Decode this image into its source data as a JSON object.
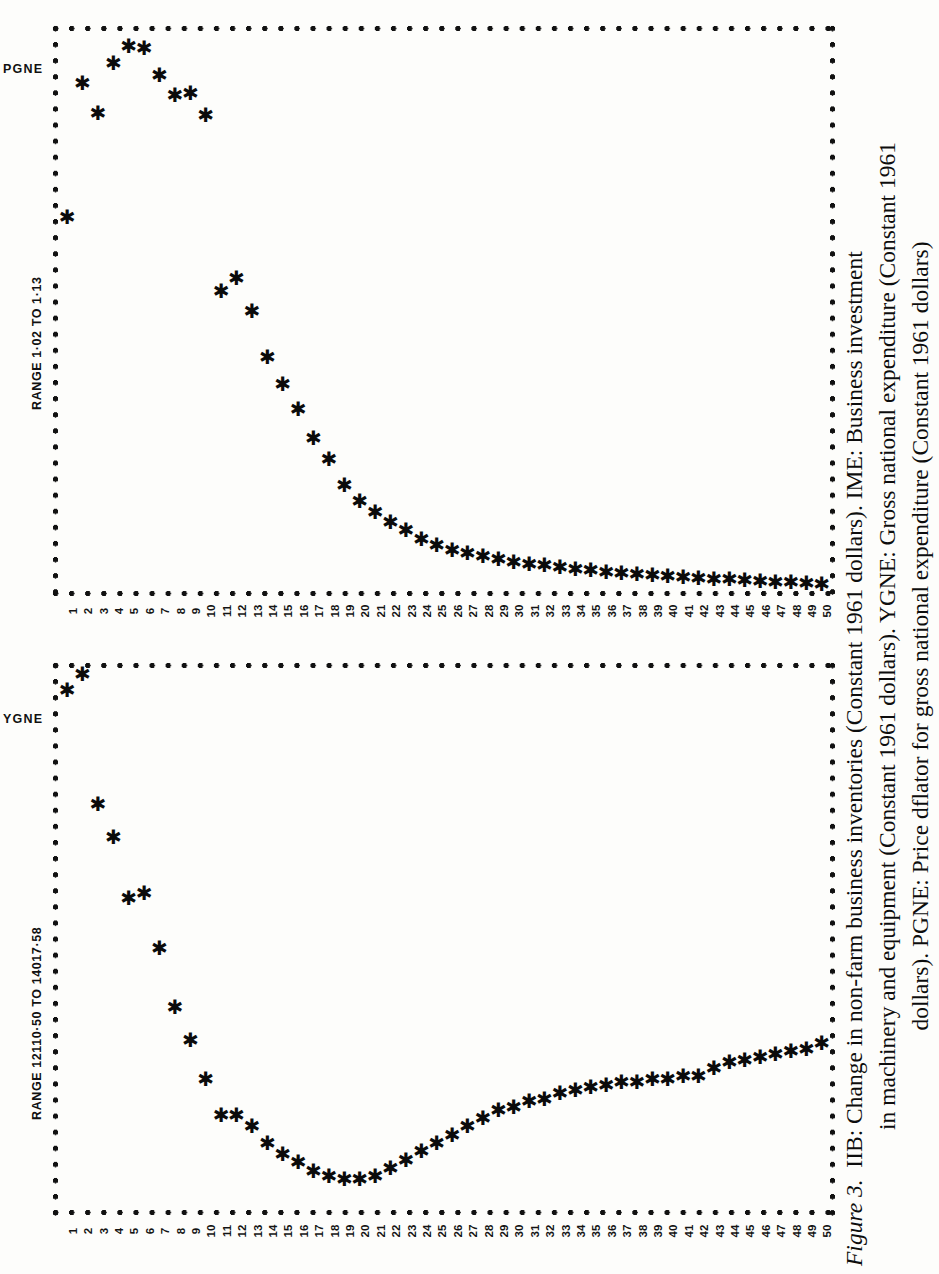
{
  "figure": {
    "label": "Figure 3.",
    "caption_lines": [
      "IIB: Change in non-farm business inventories (Constant 1961 dollars). IME: Business investment",
      "in machinery and equipment (Constant 1961 dollars). YGNE: Gross national expenditure (Constant 1961",
      "dollars). PGNE: Price dflator for gross national expenditure (Constant 1961 dollars)"
    ],
    "caption_full": "Figure 3. IIB: Change in non-farm business inventories (Constant 1961 dollars). IME: Business investment in machinery and equipment (Constant 1961 dollars). YGNE: Gross national expenditure (Constant 1961 dollars). PGNE: Price dflator for gross national expenditure (Constant 1961 dollars)"
  },
  "chart_data": [
    {
      "type": "scatter",
      "panel_id": "pgne",
      "series_name": "PGNE",
      "range_label": "RANGE 1·02 TO 1·13",
      "ylim": [
        1.02,
        1.13
      ],
      "xlabel": "",
      "ylabel": "PGNE",
      "grid": false,
      "marker": "*",
      "xticks": [
        1,
        2,
        3,
        4,
        5,
        6,
        7,
        8,
        9,
        10,
        11,
        12,
        13,
        14,
        15,
        16,
        17,
        18,
        19,
        20,
        21,
        22,
        23,
        24,
        25,
        26,
        27,
        28,
        29,
        30,
        31,
        32,
        33,
        34,
        35,
        36,
        37,
        38,
        39,
        40,
        41,
        42,
        43,
        44,
        45,
        46,
        47,
        48,
        49,
        50
      ],
      "x": [
        1,
        2,
        3,
        4,
        5,
        6,
        7,
        8,
        9,
        10,
        11,
        12,
        13,
        14,
        15,
        16,
        17,
        18,
        19,
        20,
        21,
        22,
        23,
        24,
        25,
        26,
        27,
        28,
        29,
        30,
        31,
        32,
        33,
        34,
        35,
        36,
        37,
        38,
        39,
        40,
        41,
        42,
        43,
        44,
        45,
        46,
        47,
        48,
        49,
        50
      ],
      "values": [
        1.0938,
        1.1207,
        1.1148,
        1.1247,
        1.1282,
        1.1277,
        1.1223,
        1.1183,
        1.1188,
        1.1143,
        1.0791,
        1.0816,
        1.0751,
        1.0658,
        1.0604,
        1.0554,
        1.0495,
        1.0453,
        1.04,
        1.0369,
        1.0347,
        1.0327,
        1.031,
        1.0293,
        1.028,
        1.027,
        1.0264,
        1.0258,
        1.0252,
        1.0247,
        1.0243,
        1.024,
        1.0236,
        1.0233,
        1.023,
        1.0227,
        1.0225,
        1.0223,
        1.0221,
        1.0219,
        1.0217,
        1.0215,
        1.0213,
        1.0212,
        1.021,
        1.0209,
        1.0207,
        1.0206,
        1.0204,
        1.0203
      ]
    },
    {
      "type": "scatter",
      "panel_id": "ygne",
      "series_name": "YGNE",
      "range_label": "RANGE 12110·50 TO 14017·58",
      "ylim": [
        12110.5,
        14017.58
      ],
      "xlabel": "",
      "ylabel": "YGNE",
      "grid": false,
      "marker": "*",
      "xticks": [
        1,
        2,
        3,
        4,
        5,
        6,
        7,
        8,
        9,
        10,
        11,
        12,
        13,
        14,
        15,
        16,
        17,
        18,
        19,
        20,
        21,
        22,
        23,
        24,
        25,
        26,
        27,
        28,
        29,
        30,
        31,
        32,
        33,
        34,
        35,
        36,
        37,
        38,
        39,
        40,
        41,
        42,
        43,
        44,
        45,
        46,
        47,
        48,
        49,
        50
      ],
      "x": [
        1,
        2,
        3,
        4,
        5,
        6,
        7,
        8,
        9,
        10,
        11,
        12,
        13,
        14,
        15,
        16,
        17,
        18,
        19,
        20,
        21,
        22,
        23,
        24,
        25,
        26,
        27,
        28,
        29,
        30,
        31,
        32,
        33,
        34,
        35,
        36,
        37,
        38,
        39,
        40,
        41,
        42,
        43,
        44,
        45,
        46,
        47,
        48,
        49,
        50
      ],
      "values": [
        13960.0,
        14017.58,
        13550.0,
        13430.0,
        13210.0,
        13230.0,
        13030.0,
        12820.0,
        12700.0,
        12560.0,
        12430.0,
        12430.0,
        12390.0,
        12330.0,
        12290.0,
        12260.0,
        12230.0,
        12210.0,
        12200.0,
        12200.0,
        12210.0,
        12240.0,
        12270.0,
        12300.0,
        12330.0,
        12360.0,
        12390.0,
        12420.0,
        12450.0,
        12460.0,
        12480.0,
        12490.0,
        12510.0,
        12520.0,
        12530.0,
        12540.0,
        12550.0,
        12550.0,
        12560.0,
        12560.0,
        12570.0,
        12570.0,
        12600.0,
        12620.0,
        12630.0,
        12640.0,
        12650.0,
        12660.0,
        12670.0,
        12690.0
      ]
    }
  ],
  "panels": [
    {
      "id": "pgne",
      "series_label": "PGNE",
      "range_label": "RANGE 1·02 TO 1·13"
    },
    {
      "id": "ygne",
      "series_label": "YGNE",
      "range_label": "RANGE 12110·50 TO 14017·58"
    }
  ]
}
